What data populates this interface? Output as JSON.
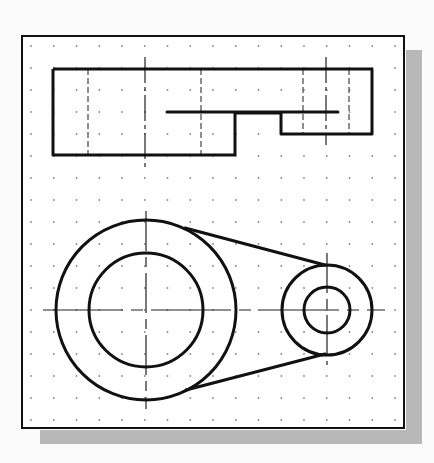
{
  "canvas": {
    "width": 434,
    "height": 463,
    "background": "#fbfbfb"
  },
  "frame": {
    "x": 22,
    "y": 36,
    "width": 382,
    "height": 392,
    "fill": "#ffffff",
    "stroke": "#111111",
    "stroke_width": 2
  },
  "shadow": {
    "color": "#b8b8b8",
    "right": {
      "x": 406,
      "y": 50,
      "width": 16,
      "height": 394
    },
    "bottom": {
      "x": 40,
      "y": 430,
      "width": 382,
      "height": 14
    }
  },
  "grid": {
    "type": "dot-grid",
    "x_start": 31,
    "x_spacing": 22.75,
    "columns": 17,
    "y_start": 46,
    "y_spacing": 22,
    "rows": 18,
    "dot_color": "#888888",
    "dot_radius": 0.9
  },
  "colors": {
    "object_line": "#111111",
    "center_line": "#222222",
    "hidden_line": "#444444"
  },
  "top_view": {
    "label": "top-view",
    "outline_points": "53,69 372,69 372,134 281,134 281,113 235,113 235,155 53,155 53,69",
    "step_line": {
      "x1": 167,
      "y1": 112,
      "x2": 338,
      "y2": 112
    },
    "hidden_lines": [
      {
        "x": 88,
        "y1": 69,
        "y2": 155
      },
      {
        "x": 201,
        "y1": 69,
        "y2": 155
      },
      {
        "x": 303,
        "y1": 69,
        "y2": 134
      },
      {
        "x": 349,
        "y1": 69,
        "y2": 134
      }
    ],
    "center_lines": [
      {
        "x": 145,
        "y1": 57,
        "y2": 168
      },
      {
        "x": 326,
        "y1": 57,
        "y2": 145
      }
    ]
  },
  "front_view": {
    "label": "front-view",
    "large_boss": {
      "cx": 146,
      "cy": 310,
      "r_outer": 90,
      "r_inner": 57
    },
    "small_boss": {
      "cx": 327,
      "cy": 310,
      "r_outer": 45,
      "r_inner": 23
    },
    "tangent_lines": [
      {
        "x1": 185,
        "y1": 228,
        "x2": 325,
        "y2": 265
      },
      {
        "x1": 186,
        "y1": 390,
        "x2": 325,
        "y2": 354
      }
    ],
    "horizontal_center_line": {
      "y": 310,
      "x1": 43,
      "x2": 385
    },
    "vertical_center_lines": [
      {
        "x": 146,
        "y1": 211,
        "y2": 409
      },
      {
        "x": 327,
        "y1": 253,
        "y2": 365
      }
    ]
  }
}
